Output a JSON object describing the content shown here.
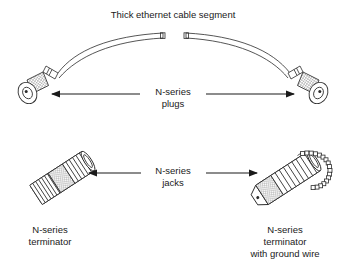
{
  "figure": {
    "title": "Thick ethernet cable segment",
    "background_color": "#ffffff",
    "line_color": "#2b2b2b",
    "text_color": "#1a1a1a",
    "hatch_color": "#9a9a9a"
  },
  "top_section": {
    "cable_label": "Thick ethernet cable segment",
    "callout_line1": "N-series",
    "callout_line2": "plugs",
    "left_arrow_direction": "left",
    "right_arrow_direction": "right",
    "components": [
      {
        "name": "n-series-plug-left",
        "label": "N-series plug"
      },
      {
        "name": "n-series-plug-right",
        "label": "N-series plug"
      }
    ]
  },
  "bottom_section": {
    "callout_line1": "N-series",
    "callout_line2": "jacks",
    "left_arrow_direction": "left",
    "right_arrow_direction": "right",
    "left_caption_line1": "N-series",
    "left_caption_line2": "terminator",
    "right_caption_line1": "N-series",
    "right_caption_line2": "terminator",
    "right_caption_line3": "with ground wire",
    "components": [
      {
        "name": "n-series-terminator",
        "label": "N-series terminator"
      },
      {
        "name": "n-series-terminator-ground-wire",
        "label": "N-series terminator with ground wire"
      }
    ]
  }
}
